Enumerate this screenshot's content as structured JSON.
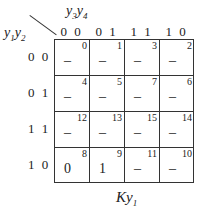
{
  "kmap": {
    "title": "Ky1",
    "title_main": "Ky",
    "title_sub": "1",
    "col_var": {
      "a": "y",
      "a_sub": "3",
      "b": "y",
      "b_sub": "4"
    },
    "row_var": {
      "a": "y",
      "a_sub": "1",
      "b": "y",
      "b_sub": "2"
    },
    "col_headers": [
      "0 0",
      "0 1",
      "1 1",
      "1 0"
    ],
    "row_headers": [
      "0 0",
      "0 1",
      "1 1",
      "1 0"
    ],
    "cells": [
      [
        {
          "index": "0",
          "value": "–"
        },
        {
          "index": "1",
          "value": "–"
        },
        {
          "index": "3",
          "value": "–"
        },
        {
          "index": "2",
          "value": "–"
        }
      ],
      [
        {
          "index": "4",
          "value": "–"
        },
        {
          "index": "5",
          "value": "–"
        },
        {
          "index": "7",
          "value": "–"
        },
        {
          "index": "6",
          "value": "–"
        }
      ],
      [
        {
          "index": "12",
          "value": "–"
        },
        {
          "index": "13",
          "value": "–"
        },
        {
          "index": "15",
          "value": "–"
        },
        {
          "index": "14",
          "value": "–"
        }
      ],
      [
        {
          "index": "8",
          "value": "0"
        },
        {
          "index": "9",
          "value": "1"
        },
        {
          "index": "11",
          "value": "–"
        },
        {
          "index": "10",
          "value": "–"
        }
      ]
    ]
  }
}
